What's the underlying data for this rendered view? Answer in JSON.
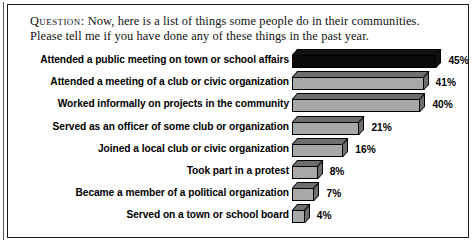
{
  "question": {
    "label": "Question:",
    "text": "Now, here is a list of things some people do in their communities. Please tell me if you have done any of these things in the past year."
  },
  "chart_data": {
    "type": "bar",
    "orientation": "horizontal",
    "title": "",
    "subtitle": "",
    "xlabel": "",
    "ylabel": "",
    "xlim": [
      0,
      50
    ],
    "grid": false,
    "legend": "none",
    "value_suffix": "%",
    "categories": [
      "Attended a public meeting on town or school affairs",
      "Attended a meeting of a club or civic organization",
      "Worked informally on projects in the community",
      "Served as an officer of some club or organization",
      "Joined a local club or civic organization",
      "Took part in a protest",
      "Became a member of a political organization",
      "Served on a town or school board"
    ],
    "values": [
      45,
      41,
      40,
      21,
      16,
      8,
      7,
      4
    ],
    "data_labels": [
      "45%",
      "41%",
      "40%",
      "21%",
      "16%",
      "8%",
      "7%",
      "4%"
    ],
    "highlight_index": 0,
    "colors": {
      "bar_fill": "#a8a8a8",
      "bar_fill_highlight": "#0a0a0a",
      "bar_side": "#6e6e6e",
      "bar_outline": "#000000",
      "text": "#000000",
      "background": "#ffffff",
      "frame": "#1a1a1a"
    }
  }
}
